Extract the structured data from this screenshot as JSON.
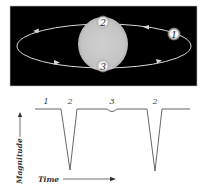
{
  "orbit_panel": {
    "background": "#000000",
    "star_color": "#c8c8c8",
    "orbit_color": "#d8d8d8",
    "planets": [
      {
        "position": "1",
        "label": "1"
      },
      {
        "position": "2",
        "label": "2"
      },
      {
        "position": "3",
        "label": "3"
      }
    ]
  },
  "light_curve": {
    "phase_labels": [
      "1",
      "2",
      "3",
      "2"
    ],
    "y_axis_label": "Magnitude",
    "x_axis_label": "Time",
    "line_color": "#555555"
  }
}
